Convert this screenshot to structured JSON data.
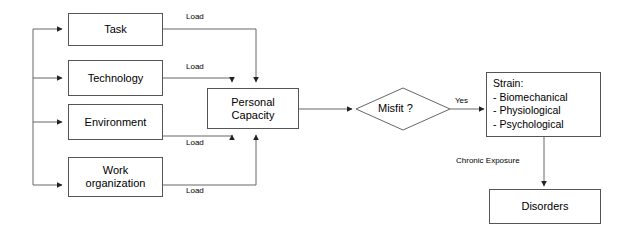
{
  "diagram": {
    "type": "flowchart",
    "nodes": {
      "task": {
        "label": "Task"
      },
      "technology": {
        "label": "Technology"
      },
      "environment": {
        "label": "Environment"
      },
      "work_organization": {
        "label": "Work\norganization"
      },
      "personal_capacity": {
        "label": "Personal\nCapacity"
      },
      "misfit": {
        "label": "Misfit ?"
      },
      "strain": {
        "title": "Strain:",
        "items": [
          "- Biomechanical",
          "- Physiological",
          "- Psychological"
        ]
      },
      "disorders": {
        "label": "Disorders"
      }
    },
    "edge_labels": {
      "load_task": "Load",
      "load_technology": "Load",
      "load_environment": "Load",
      "load_work_organization": "Load",
      "yes": "Yes",
      "chronic_exposure": "Chronic Exposure"
    },
    "colors": {
      "stroke": "#555555",
      "line": "#666666",
      "text": "#000000",
      "background": "#ffffff"
    }
  }
}
